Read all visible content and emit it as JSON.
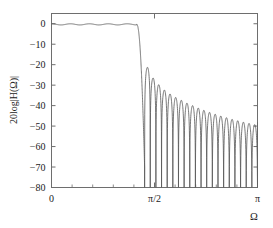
{
  "figure": {
    "background_color": "#ffffff",
    "axes_color": "#6e6e6e",
    "line_color": "#555555",
    "text_color": "#1a1a1a"
  },
  "chart_data": {
    "type": "line",
    "title": "",
    "subtitle": "",
    "xlabel": "Ω",
    "ylabel": "20log|H(Ω)|",
    "xlim": [
      0,
      3.14159265
    ],
    "ylim": [
      -80,
      5
    ],
    "grid": false,
    "legend": null,
    "legend_position": "none",
    "x_ticks": [
      0,
      1.5707963,
      3.14159265
    ],
    "x_ticklabels": [
      "0",
      "π/2",
      "π"
    ],
    "y_ticks": [
      0,
      -10,
      -20,
      -30,
      -40,
      -50,
      -60,
      -70,
      -80
    ],
    "y_ticklabels": [
      "0",
      "−10",
      "−20",
      "−30",
      "−40",
      "−50",
      "−60",
      "−70",
      "−80"
    ],
    "x_minor_tick_count": 4,
    "series": [
      {
        "name": "|H(Ω)| in dB",
        "passband": {
          "edge_omega": 1.3,
          "ripple_db": 0.55,
          "ripple_cycles": 4.5,
          "mean_db": -0.3
        },
        "transition": {
          "start_omega": 1.3,
          "end_omega": 1.42,
          "end_db": -70
        },
        "stopband": {
          "start_omega": 1.42,
          "null_count": 20,
          "peak_envelope_db": [
            -21.3,
            -26.5,
            -29.8,
            -32.4,
            -34.3,
            -36.0,
            -37.4,
            -38.8,
            -40.0,
            -41.2,
            -42.3,
            -43.3,
            -44.2,
            -45.1,
            -45.9,
            -46.7,
            -47.4,
            -48.1,
            -48.7,
            -49.3
          ],
          "null_depth_db": -80
        }
      }
    ]
  }
}
